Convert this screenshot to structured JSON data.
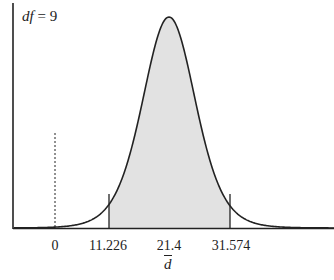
{
  "chart_data": {
    "type": "area",
    "title": "",
    "annotation": "df = 9",
    "df_label": "df",
    "df_value": "= 9",
    "xlabel": "d̄",
    "ylabel": "",
    "distribution": "t-distribution (sampling distribution of mean difference)",
    "center": 21.4,
    "shaded_region": [
      11.226,
      31.574
    ],
    "reference_line": 0,
    "x_ticks": [
      "0",
      "11.226",
      "21.4",
      "31.574"
    ],
    "grid": false
  },
  "labels": {
    "tick0": "0",
    "tick1": "11.226",
    "tick2": "21.4",
    "tick3": "31.574",
    "xtitle": "d"
  }
}
